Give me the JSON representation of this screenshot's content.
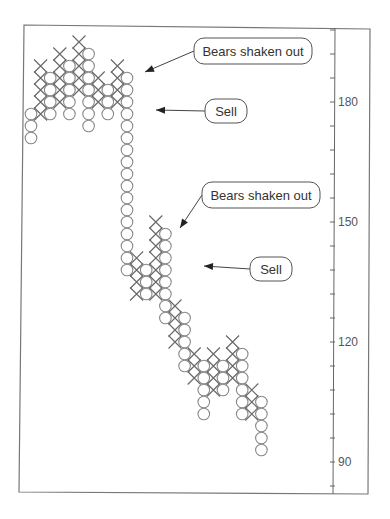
{
  "chart_data": {
    "type": "point-and-figure",
    "title": "",
    "xlabel": "",
    "ylabel": "",
    "ylim": [
      82,
      196
    ],
    "box_size": 3,
    "y_axis": {
      "side": "right",
      "tick_labels": [
        180,
        150,
        120,
        90
      ],
      "minor_tick_step": 6
    },
    "grid": false,
    "columns": [
      {
        "type": "O",
        "top": 177,
        "bottom": 171
      },
      {
        "type": "X",
        "top": 189,
        "bottom": 177
      },
      {
        "type": "O",
        "top": 186,
        "bottom": 177
      },
      {
        "type": "X",
        "top": 192,
        "bottom": 180
      },
      {
        "type": "O",
        "top": 189,
        "bottom": 177
      },
      {
        "type": "X",
        "top": 195,
        "bottom": 183
      },
      {
        "type": "O",
        "top": 192,
        "bottom": 174
      },
      {
        "type": "X",
        "top": 186,
        "bottom": 180
      },
      {
        "type": "O",
        "top": 183,
        "bottom": 177
      },
      {
        "type": "X",
        "top": 189,
        "bottom": 180
      },
      {
        "type": "O",
        "top": 186,
        "bottom": 138
      },
      {
        "type": "X",
        "top": 141,
        "bottom": 132
      },
      {
        "type": "O",
        "top": 138,
        "bottom": 132
      },
      {
        "type": "X",
        "top": 150,
        "bottom": 132
      },
      {
        "type": "O",
        "top": 147,
        "bottom": 126
      },
      {
        "type": "X",
        "top": 129,
        "bottom": 120
      },
      {
        "type": "O",
        "top": 126,
        "bottom": 114
      },
      {
        "type": "X",
        "top": 117,
        "bottom": 111
      },
      {
        "type": "O",
        "top": 114,
        "bottom": 102
      },
      {
        "type": "X",
        "top": 117,
        "bottom": 108
      },
      {
        "type": "O",
        "top": 114,
        "bottom": 108
      },
      {
        "type": "X",
        "top": 120,
        "bottom": 111
      },
      {
        "type": "O",
        "top": 117,
        "bottom": 102
      },
      {
        "type": "X",
        "top": 108,
        "bottom": 102
      },
      {
        "type": "O",
        "top": 105,
        "bottom": 93
      }
    ],
    "annotations": [
      {
        "text": "Bears shaken out",
        "target_column": 9,
        "target_value": 189
      },
      {
        "text": "Sell",
        "target_column": 10,
        "target_value": 180
      },
      {
        "text": "Bears shaken out",
        "target_column": 13,
        "target_value": 150
      },
      {
        "text": "Sell",
        "target_column": 14,
        "target_value": 141
      }
    ]
  },
  "callouts": [
    {
      "label": "Bears shaken out",
      "x": 194,
      "y": 38,
      "w": 118,
      "h": 26,
      "ax": 145,
      "ay": 72
    },
    {
      "label": "Sell",
      "x": 205,
      "y": 99,
      "w": 42,
      "h": 24,
      "ax": 156,
      "ay": 110
    },
    {
      "label": "Bears shaken out",
      "x": 202,
      "y": 182,
      "w": 118,
      "h": 26,
      "ax": 180,
      "ay": 228
    },
    {
      "label": "Sell",
      "x": 250,
      "y": 257,
      "w": 42,
      "h": 24,
      "ax": 204,
      "ay": 266
    }
  ]
}
